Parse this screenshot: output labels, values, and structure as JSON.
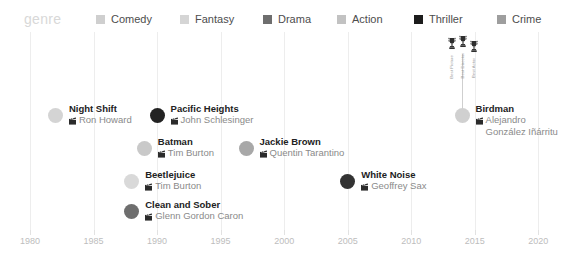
{
  "legend": {
    "title": "genre",
    "items": [
      {
        "label": "Comedy",
        "color": "#cfcfcf"
      },
      {
        "label": "Fantasy",
        "color": "#d5d5d5"
      },
      {
        "label": "Drama",
        "color": "#6e6e6e"
      },
      {
        "label": "Action",
        "color": "#c2c2c2"
      },
      {
        "label": "Thriller",
        "color": "#1c1c1c"
      },
      {
        "label": "Crime",
        "color": "#9e9e9e"
      }
    ]
  },
  "axis": {
    "ticks": [
      "1980",
      "1985",
      "1990",
      "1995",
      "2000",
      "2005",
      "2010",
      "2015",
      "2020"
    ],
    "min": 1980,
    "max": 2021
  },
  "chart_data": {
    "type": "scatter",
    "title": "genre",
    "xlabel": "",
    "ylabel": "",
    "xlim": [
      1980,
      2021
    ],
    "grid": true,
    "legend_position": "top",
    "director_icon": "film-clapper-icon",
    "points": [
      {
        "title": "Night Shift",
        "director": "Ron Howard",
        "year": 1982,
        "genre": "Comedy",
        "color": "#d4d4d4"
      },
      {
        "title": "Pacific Heights",
        "director": "John Schlesinger",
        "year": 1990,
        "genre": "Thriller",
        "color": "#232323"
      },
      {
        "title": "Batman",
        "director": "Tim Burton",
        "year": 1989,
        "genre": "Action",
        "color": "#c9c9c9"
      },
      {
        "title": "Jackie Brown",
        "director": "Quentin Tarantino",
        "year": 1997,
        "genre": "Crime",
        "color": "#a8a8a8"
      },
      {
        "title": "Beetlejuice",
        "director": "Tim Burton",
        "year": 1988,
        "genre": "Fantasy",
        "color": "#d9d9d9"
      },
      {
        "title": "White Noise",
        "director": "Geoffrey Sax",
        "year": 2005,
        "genre": "Thriller",
        "color": "#333333"
      },
      {
        "title": "Clean and Sober",
        "director": "Glenn Gordon Caron",
        "year": 1988,
        "genre": "Drama",
        "color": "#6e6e6e"
      },
      {
        "title": "Birdman",
        "director": "Alejandro González Iñárritu",
        "year": 2014,
        "genre": "Comedy",
        "color": "#d0d0d0"
      }
    ],
    "awards": {
      "for_title": "Birdman",
      "items": [
        {
          "label": "Best Picture",
          "icon": "trophy-icon"
        },
        {
          "label": "Best Director",
          "icon": "trophy-icon"
        },
        {
          "label": "Best Actor",
          "icon": "trophy-icon"
        }
      ]
    }
  }
}
